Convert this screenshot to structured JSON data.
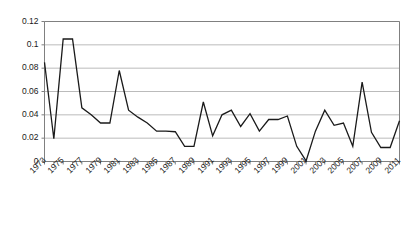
{
  "chart_data": {
    "type": "line",
    "title": "",
    "subtitle": "",
    "xlabel": "",
    "ylabel": "",
    "xlim": [
      1973,
      2011
    ],
    "ylim": [
      0,
      0.12
    ],
    "grid": true,
    "grid_axis": "y",
    "legend": false,
    "legend_position": "none",
    "line_color": "#1a1a1a",
    "grid_color": "#b3b3b3",
    "axis_color": "#808080",
    "background_color": "#ffffff",
    "y_ticks": [
      0,
      0.02,
      0.04,
      0.06,
      0.08,
      0.1,
      0.12
    ],
    "y_tick_labels": [
      "0",
      "0.02",
      "0.04",
      "0.06",
      "0.08",
      "0.1",
      "0.12"
    ],
    "x_ticks": [
      1973,
      1974,
      1975,
      1976,
      1977,
      1978,
      1979,
      1980,
      1981,
      1982,
      1983,
      1984,
      1985,
      1986,
      1987,
      1988,
      1989,
      1990,
      1991,
      1992,
      1993,
      1994,
      1995,
      1996,
      1997,
      1998,
      1999,
      2000,
      2001,
      2002,
      2003,
      2004,
      2005,
      2006,
      2007,
      2008,
      2009,
      2010,
      2011
    ],
    "x_tick_labels": [
      "1973",
      "1975",
      "1977",
      "1979",
      "1981",
      "1983",
      "1985",
      "1987",
      "1989",
      "1991",
      "1993",
      "1995",
      "1997",
      "1999",
      "2001",
      "2003",
      "2005",
      "2007",
      "2009",
      "2011"
    ],
    "x_tick_labels_years": [
      1973,
      1975,
      1977,
      1979,
      1981,
      1983,
      1985,
      1987,
      1989,
      1991,
      1993,
      1995,
      1997,
      1999,
      2001,
      2003,
      2005,
      2007,
      2009,
      2011
    ],
    "x": [
      1973,
      1974,
      1975,
      1976,
      1977,
      1978,
      1979,
      1980,
      1981,
      1982,
      1983,
      1984,
      1985,
      1986,
      1987,
      1988,
      1989,
      1990,
      1991,
      1992,
      1993,
      1994,
      1995,
      1996,
      1997,
      1998,
      1999,
      2000,
      2001,
      2002,
      2003,
      2004,
      2005,
      2006,
      2007,
      2008,
      2009,
      2010,
      2011
    ],
    "values": [
      0.085,
      0.0195,
      0.105,
      0.105,
      0.046,
      0.04,
      0.033,
      0.033,
      0.078,
      0.044,
      0.038,
      0.033,
      0.026,
      0.026,
      0.0255,
      0.013,
      0.013,
      0.051,
      0.022,
      0.04,
      0.044,
      0.03,
      0.041,
      0.026,
      0.036,
      0.036,
      0.039,
      0.013,
      0.0005,
      0.026,
      0.044,
      0.031,
      0.033,
      0.013,
      0.068,
      0.025,
      0.012,
      0.012,
      0.035
    ],
    "series": [
      {
        "name": "series-1",
        "values": [
          0.085,
          0.0195,
          0.105,
          0.105,
          0.046,
          0.04,
          0.033,
          0.033,
          0.078,
          0.044,
          0.038,
          0.033,
          0.026,
          0.026,
          0.0255,
          0.013,
          0.013,
          0.051,
          0.022,
          0.04,
          0.044,
          0.03,
          0.041,
          0.026,
          0.036,
          0.036,
          0.039,
          0.013,
          0.0005,
          0.026,
          0.044,
          0.031,
          0.033,
          0.013,
          0.068,
          0.025,
          0.012,
          0.012,
          0.035
        ]
      }
    ]
  }
}
